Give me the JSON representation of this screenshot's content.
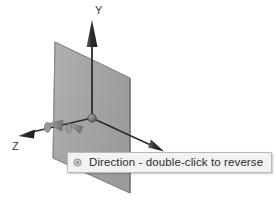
{
  "scene": {
    "kind": "3d-axis-widget",
    "background_color": "#ffffff",
    "plane": {
      "name": "reference-plane",
      "fill_color": "#a8a8a8",
      "edge_color": "#6f6f6f",
      "corners": [
        [
          55,
          42
        ],
        [
          130,
          78
        ],
        [
          130,
          193
        ],
        [
          53,
          158
        ]
      ]
    },
    "origin": {
      "x": 92,
      "y": 118,
      "color": "#707070"
    },
    "axes": [
      {
        "id": "y",
        "label": "Y",
        "label_x": 98,
        "label_y": 14,
        "color": "#2f2f2f",
        "from": [
          92,
          118
        ],
        "to": [
          92,
          24
        ],
        "direction": "up"
      },
      {
        "id": "x",
        "label": "X",
        "label_x": 150,
        "label_y": 157,
        "color": "#2f2f2f",
        "from": [
          92,
          118
        ],
        "to": [
          160,
          150
        ],
        "direction": "down-right"
      },
      {
        "id": "z",
        "label": "Z",
        "label_x": 12,
        "label_y": 150,
        "color": "#2f2f2f",
        "from": [
          92,
          118
        ],
        "to": [
          22,
          135
        ],
        "direction": "down-left"
      }
    ],
    "manipulator_arrows": [
      {
        "id": "x-handle",
        "color": "#8a8a8a"
      },
      {
        "id": "z-handle",
        "color": "#8a8a8a"
      }
    ]
  },
  "tooltip": {
    "text": "Direction - double-click to reverse",
    "icon": "dot-icon",
    "background_color": "#f2f2f0",
    "border_color": "#b9b9b7",
    "text_color": "#2c2c2c"
  }
}
